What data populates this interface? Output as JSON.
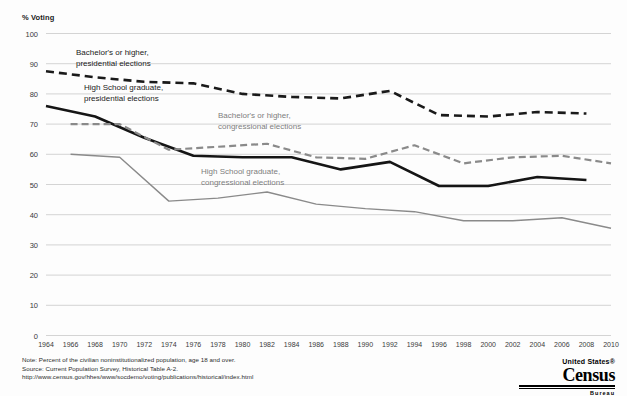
{
  "chart_data": {
    "type": "line",
    "title": "",
    "ylabel": "% Voting",
    "xlabel": "",
    "ylim": [
      0,
      100
    ],
    "yticks": [
      0,
      10,
      20,
      30,
      40,
      50,
      60,
      70,
      80,
      90,
      100
    ],
    "grid": true,
    "legend_position": "inline-annotations",
    "x": [
      1964,
      1966,
      1968,
      1970,
      1972,
      1974,
      1976,
      1978,
      1980,
      1982,
      1984,
      1986,
      1988,
      1990,
      1992,
      1994,
      1996,
      1998,
      2000,
      2002,
      2004,
      2006,
      2008,
      2010
    ],
    "xticklabels": [
      "1964",
      "1966",
      "1968",
      "1970",
      "1972",
      "1974",
      "1976",
      "1978",
      "1980",
      "1982",
      "1984",
      "1986",
      "1988",
      "1990",
      "1992",
      "1994",
      "1996",
      "1998",
      "2000",
      "2002",
      "2004",
      "2006",
      "2008",
      "2010"
    ],
    "series": [
      {
        "name": "Bachelor's or higher, presidential elections",
        "style": "dashed",
        "color": "#1a1a1a",
        "width": 2.6,
        "x": [
          1964,
          1968,
          1972,
          1976,
          1980,
          1984,
          1988,
          1992,
          1996,
          2000,
          2004,
          2008
        ],
        "values": [
          87.5,
          85.5,
          84.0,
          83.5,
          80.0,
          79.0,
          78.5,
          81.0,
          73.0,
          72.5,
          74.0,
          73.5
        ]
      },
      {
        "name": "High School graduate, presidential elections",
        "style": "solid",
        "color": "#151515",
        "width": 2.6,
        "x": [
          1964,
          1968,
          1972,
          1976,
          1980,
          1984,
          1988,
          1992,
          1996,
          2000,
          2004,
          2008
        ],
        "values": [
          76.0,
          72.5,
          65.5,
          59.5,
          59.0,
          59.0,
          55.0,
          57.5,
          49.5,
          49.5,
          52.5,
          51.5
        ]
      },
      {
        "name": "Bachelor's or higher, congressional elections",
        "style": "dashed",
        "color": "#8a8a8a",
        "width": 2.2,
        "x": [
          1966,
          1970,
          1974,
          1978,
          1982,
          1986,
          1990,
          1994,
          1998,
          2002,
          2006,
          2010
        ],
        "values": [
          70.0,
          70.0,
          61.5,
          62.5,
          63.5,
          59.0,
          58.5,
          63.0,
          57.0,
          59.0,
          59.5,
          57.0
        ]
      },
      {
        "name": "High School graduate, congressional elections",
        "style": "solid",
        "color": "#8a8a8a",
        "width": 1.4,
        "x": [
          1966,
          1970,
          1974,
          1978,
          1982,
          1986,
          1990,
          1994,
          1998,
          2002,
          2006,
          2010
        ],
        "values": [
          60.0,
          59.0,
          44.5,
          45.5,
          47.5,
          43.5,
          42.0,
          41.0,
          38.0,
          38.0,
          39.0,
          35.5
        ]
      }
    ],
    "annotations": [
      {
        "id": "bachelor-presidential",
        "line1": "Bachelor's or higher,",
        "line2": "presidential elections",
        "color": "#1a1a1a"
      },
      {
        "id": "highschool-presidential",
        "line1": "High School graduate,",
        "line2": "presidential elections",
        "color": "#1a1a1a"
      },
      {
        "id": "bachelor-congressional",
        "line1": "Bachelor's or higher,",
        "line2": "congressional elections",
        "color": "#7e7e7e"
      },
      {
        "id": "highschool-congressional",
        "line1": "High School graduate,",
        "line2": "congressional elections",
        "color": "#7e7e7e"
      }
    ]
  },
  "footnotes": {
    "note": "Note: Percent of the civilian noninstitutionalized population, age 18 and over.",
    "source": "Source: Current Population Survey, Historical Table A-2.",
    "url": "http://www.census.gov/hhes/www/socdemo/voting/publications/historical/index.html"
  },
  "logo": {
    "united_states": "United States®",
    "census": "Census",
    "bureau": "Bureau"
  }
}
